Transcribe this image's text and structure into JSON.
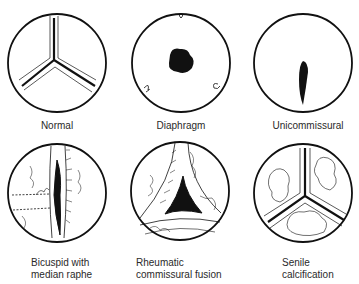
{
  "figures": [
    {
      "id": "normal",
      "label": "Normal"
    },
    {
      "id": "diaphragm",
      "label": "Diaphragm"
    },
    {
      "id": "unicommissural",
      "label": "Unicommissural"
    },
    {
      "id": "bicuspid",
      "label_line1": "Bicuspid with",
      "label_line2": "median raphe"
    },
    {
      "id": "rheumatic",
      "label_line1": "Rheumatic",
      "label_line2": "commissural fusion"
    },
    {
      "id": "senile",
      "label_line1": "Senile",
      "label_line2": "calcification"
    }
  ],
  "colors": {
    "ink": "#111111",
    "background": "#ffffff"
  }
}
